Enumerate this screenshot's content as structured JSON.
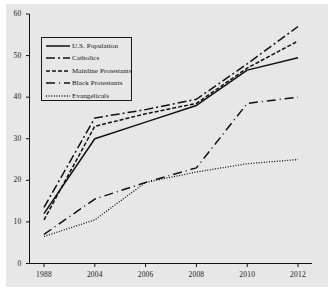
{
  "chart_data": {
    "type": "line",
    "title": "",
    "subtitle": "",
    "xlabel": "",
    "ylabel": "",
    "x": [
      "1988",
      "2004",
      "2006",
      "2008",
      "2010",
      "2012"
    ],
    "categories": [
      "1988",
      "2004",
      "2006",
      "2008",
      "2010",
      "2012"
    ],
    "ylim": [
      0,
      60
    ],
    "yticks": [
      0,
      10,
      20,
      30,
      40,
      50,
      60
    ],
    "ytick_labels": [
      "0",
      "10",
      "20",
      "30",
      "40",
      "50",
      "60"
    ],
    "xtick_labels": [
      "1988",
      "2004",
      "2006",
      "2008",
      "2010",
      "2012"
    ],
    "grid": false,
    "legend_position": "upper-left",
    "background_color": "#e7e7e7",
    "line_color": "#111111",
    "series": [
      {
        "name": "U.S. Population",
        "style": "solid",
        "values": [
          12,
          30,
          34,
          38,
          46.5,
          49.5
        ]
      },
      {
        "name": "Catholics",
        "style": "long-dash",
        "values": [
          13.5,
          35,
          37,
          39.5,
          48,
          57
        ]
      },
      {
        "name": "Mainline Protestants",
        "style": "short-dash",
        "values": [
          10.5,
          33,
          36,
          38.5,
          47,
          53.5
        ]
      },
      {
        "name": "Black Protestants",
        "style": "dash-dot",
        "values": [
          7,
          15.5,
          19.5,
          23,
          38.5,
          40
        ]
      },
      {
        "name": "Evangelicals",
        "style": "dotted",
        "values": [
          6.5,
          10.5,
          19.5,
          22,
          24,
          25
        ]
      }
    ]
  },
  "legend": {
    "entries": [
      {
        "label": "U.S. Population"
      },
      {
        "label": "Catholics"
      },
      {
        "label": "Mainline Protestants"
      },
      {
        "label": "Black Protestants"
      },
      {
        "label": "Evangelicals"
      }
    ]
  },
  "axes": {
    "y_ticks": [
      "0",
      "10",
      "20",
      "30",
      "40",
      "50",
      "60"
    ],
    "x_ticks": [
      "1988",
      "2004",
      "2006",
      "2008",
      "2010",
      "2012"
    ]
  }
}
